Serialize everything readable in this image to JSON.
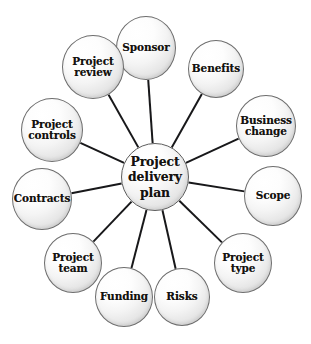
{
  "diagram": {
    "type": "radial-hub-and-spoke",
    "background_color": "#ffffff",
    "edge_color": "#18181a",
    "edge_width": 2,
    "node_border_color": "#6d6d6d",
    "node_fill_light": "#ffffff",
    "node_fill_shade": "#e0e0e0",
    "hub": {
      "id": "hub",
      "label": "Project\ndelivery\nplan",
      "cx": 155,
      "cy": 177,
      "rx": 34,
      "ry": 34
    },
    "satellites": [
      {
        "id": "sponsor",
        "label": "Sponsor",
        "cx": 146,
        "cy": 48,
        "rx": 30,
        "ry": 32
      },
      {
        "id": "benefits",
        "label": "Benefits",
        "cx": 216,
        "cy": 69,
        "rx": 28,
        "ry": 29
      },
      {
        "id": "business-change",
        "label": "Business\nchange",
        "cx": 266,
        "cy": 126,
        "rx": 30,
        "ry": 31
      },
      {
        "id": "scope",
        "label": "Scope",
        "cx": 273,
        "cy": 196,
        "rx": 29,
        "ry": 30
      },
      {
        "id": "project-type",
        "label": "Project\ntype",
        "cx": 243,
        "cy": 263,
        "rx": 29,
        "ry": 30
      },
      {
        "id": "risks",
        "label": "Risks",
        "cx": 182,
        "cy": 297,
        "rx": 28,
        "ry": 29
      },
      {
        "id": "funding",
        "label": "Funding",
        "cx": 124,
        "cy": 297,
        "rx": 29,
        "ry": 30
      },
      {
        "id": "project-team",
        "label": "Project\nteam",
        "cx": 73,
        "cy": 263,
        "rx": 29,
        "ry": 30
      },
      {
        "id": "contracts",
        "label": "Contracts",
        "cx": 42,
        "cy": 199,
        "rx": 30,
        "ry": 31
      },
      {
        "id": "project-controls",
        "label": "Project\ncontrols",
        "cx": 52,
        "cy": 130,
        "rx": 31,
        "ry": 32
      },
      {
        "id": "project-review",
        "label": "Project\nreview",
        "cx": 93,
        "cy": 67,
        "rx": 31,
        "ry": 32
      }
    ],
    "edges": [
      {
        "from": "hub",
        "to": "sponsor"
      },
      {
        "from": "hub",
        "to": "benefits"
      },
      {
        "from": "hub",
        "to": "business-change"
      },
      {
        "from": "hub",
        "to": "scope"
      },
      {
        "from": "hub",
        "to": "project-type"
      },
      {
        "from": "hub",
        "to": "risks"
      },
      {
        "from": "hub",
        "to": "funding"
      },
      {
        "from": "hub",
        "to": "project-team"
      },
      {
        "from": "hub",
        "to": "contracts"
      },
      {
        "from": "hub",
        "to": "project-controls"
      },
      {
        "from": "hub",
        "to": "project-review"
      }
    ],
    "caption": ""
  }
}
